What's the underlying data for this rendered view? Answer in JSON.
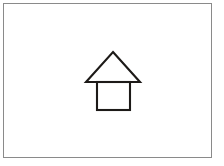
{
  "canvas": {
    "name": "house-line-drawing",
    "title": "House",
    "background_color": "#ffffff",
    "border_color": "#8a8a8a",
    "border_width_px": 1,
    "frame": {
      "x": 3,
      "y": 3,
      "width": 209,
      "height": 155
    }
  },
  "drawing": {
    "stroke_color": "#1d1a18",
    "stroke_width_px": 2,
    "fill": "none",
    "shapes": [
      {
        "name": "roof-triangle",
        "type": "triangle",
        "points": "113,52 140,82 86,82",
        "apex": {
          "x": 113,
          "y": 52
        },
        "base_left": {
          "x": 86,
          "y": 82
        },
        "base_right": {
          "x": 140,
          "y": 82
        }
      },
      {
        "name": "body-square",
        "type": "rectangle",
        "x": 97,
        "y": 82,
        "width": 33,
        "height": 28
      }
    ]
  },
  "chart_data": {
    "type": "table",
    "categories": [
      "roof-triangle",
      "body-square"
    ],
    "values": [
      "apex (113,52) base (86,82)-(140,82)",
      "rect x=97 y=82 w=33 h=28"
    ],
    "xlabel": "",
    "ylabel": "",
    "grid": false,
    "legend": "none"
  }
}
